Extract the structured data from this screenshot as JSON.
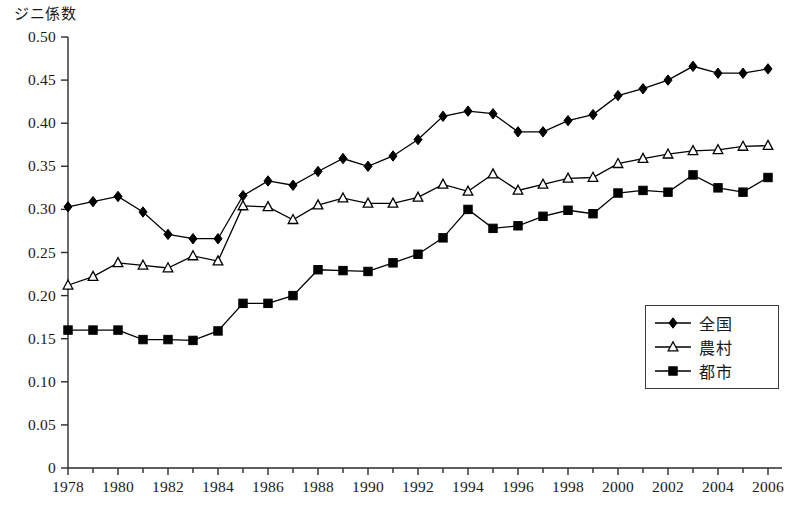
{
  "chart_data": {
    "type": "line",
    "title": "",
    "ylabel": "ジニ係数",
    "xlabel": "",
    "ylim": [
      0,
      0.5
    ],
    "ytick_step": 0.05,
    "ytick_labels": [
      "0.50",
      "0.45",
      "0.40",
      "0.35",
      "0.30",
      "0.25",
      "0.20",
      "0.15",
      "0.10",
      "0.05",
      "0"
    ],
    "ytick_values": [
      0.5,
      0.45,
      0.4,
      0.35,
      0.3,
      0.25,
      0.2,
      0.15,
      0.1,
      0.05,
      0
    ],
    "xlim": [
      1978,
      2006
    ],
    "x": [
      1978,
      1979,
      1980,
      1981,
      1982,
      1983,
      1984,
      1985,
      1986,
      1987,
      1988,
      1989,
      1990,
      1991,
      1992,
      1993,
      1994,
      1995,
      1996,
      1997,
      1998,
      1999,
      2000,
      2001,
      2002,
      2003,
      2004,
      2005,
      2006
    ],
    "xtick_labels": [
      "1978",
      "1980",
      "1982",
      "1984",
      "1986",
      "1988",
      "1990",
      "1992",
      "1994",
      "1996",
      "1998",
      "2000",
      "2002",
      "2004",
      "2006"
    ],
    "xtick_values": [
      1978,
      1980,
      1982,
      1984,
      1986,
      1988,
      1990,
      1992,
      1994,
      1996,
      1998,
      2000,
      2002,
      2004,
      2006
    ],
    "grid": false,
    "legend_position": "bottom-right",
    "series": [
      {
        "name": "全国",
        "marker": "filled-diamond",
        "color": "#000000",
        "values": [
          0.303,
          0.309,
          0.315,
          0.297,
          0.271,
          0.266,
          0.266,
          0.316,
          0.333,
          0.328,
          0.344,
          0.359,
          0.35,
          0.362,
          0.381,
          0.408,
          0.414,
          0.411,
          0.39,
          0.39,
          0.403,
          0.41,
          0.432,
          0.44,
          0.45,
          0.466,
          0.458,
          0.458,
          0.463
        ]
      },
      {
        "name": "農村",
        "marker": "open-triangle",
        "color": "#000000",
        "values": [
          0.212,
          0.222,
          0.238,
          0.235,
          0.232,
          0.246,
          0.24,
          0.304,
          0.303,
          0.288,
          0.305,
          0.313,
          0.307,
          0.307,
          0.314,
          0.329,
          0.321,
          0.341,
          0.322,
          0.329,
          0.336,
          0.337,
          0.353,
          0.359,
          0.364,
          0.368,
          0.369,
          0.373,
          0.374
        ]
      },
      {
        "name": "都市",
        "marker": "filled-square",
        "color": "#000000",
        "values": [
          0.16,
          0.16,
          0.16,
          0.149,
          0.149,
          0.148,
          0.159,
          0.191,
          0.191,
          0.2,
          0.23,
          0.229,
          0.228,
          0.238,
          0.248,
          0.267,
          0.3,
          0.278,
          0.281,
          0.292,
          0.299,
          0.295,
          0.319,
          0.322,
          0.32,
          0.34,
          0.325,
          0.32,
          0.337
        ]
      }
    ]
  },
  "legend": {
    "items": [
      {
        "label": "全国",
        "marker": "filled-diamond"
      },
      {
        "label": "農村",
        "marker": "open-triangle"
      },
      {
        "label": "都市",
        "marker": "filled-square"
      }
    ]
  }
}
